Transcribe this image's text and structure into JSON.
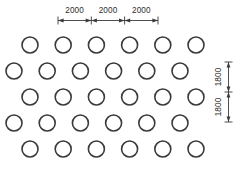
{
  "figure": {
    "background_color": "#ffffff",
    "line_color": "#3a3a3a",
    "text_color": "#2e2e2e"
  },
  "horizontal_dimensions": {
    "label_1": "2000",
    "label_2": "2000",
    "label_3": "2000"
  },
  "vertical_dimensions": {
    "label_1": "1800",
    "label_2": "1800"
  },
  "chart_data": {
    "type": "scatter",
    "xlabel": "",
    "ylabel": "",
    "grid": false,
    "legend": null,
    "circle_radius_px": 8,
    "row_count": 5,
    "columns_per_row": 6,
    "row_offsets_px": [
      30,
      14,
      30,
      14,
      30
    ],
    "row_pitch_px": 26,
    "column_pitch_px": 33.2,
    "rows": [
      {
        "index": 1,
        "cy": 45,
        "cx": [
          30,
          63.2,
          96.4,
          129.6,
          162.8,
          196
        ]
      },
      {
        "index": 2,
        "cy": 71,
        "cx": [
          14,
          47.2,
          80.4,
          113.6,
          146.8,
          180
        ]
      },
      {
        "index": 3,
        "cy": 97,
        "cx": [
          30,
          63.2,
          96.4,
          129.6,
          162.8,
          196
        ]
      },
      {
        "index": 4,
        "cy": 123,
        "cx": [
          14,
          47.2,
          80.4,
          113.6,
          146.8,
          180
        ]
      },
      {
        "index": 5,
        "cy": 149,
        "cx": [
          30,
          63.2,
          96.4,
          129.6,
          162.8,
          196
        ]
      }
    ],
    "annotations": [
      {
        "text": "2000",
        "axis": "horizontal",
        "segment": 1,
        "from_px": 58,
        "to_px": 91.3
      },
      {
        "text": "2000",
        "axis": "horizontal",
        "segment": 2,
        "from_px": 91.3,
        "to_px": 124.6
      },
      {
        "text": "2000",
        "axis": "horizontal",
        "segment": 3,
        "from_px": 124.6,
        "to_px": 158
      },
      {
        "text": "1800",
        "axis": "vertical",
        "segment": 1,
        "from_px": 62,
        "to_px": 92
      },
      {
        "text": "1800",
        "axis": "vertical",
        "segment": 2,
        "from_px": 92,
        "to_px": 122
      }
    ]
  }
}
